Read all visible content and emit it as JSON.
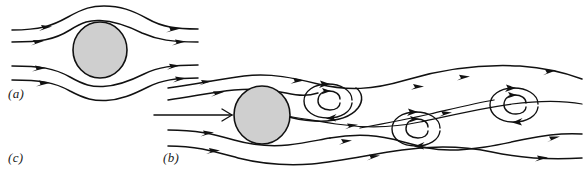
{
  "figure": {
    "background_color": "#ffffff",
    "line_color": "#111111",
    "cylinder_fill_color": "#cfcfcf",
    "width": 584,
    "height": 182
  },
  "labels": {
    "a": "(a)",
    "b": "(b)",
    "c": "(c)"
  },
  "panels": [
    {
      "id": "a",
      "label": "(a)",
      "caption": "",
      "flow_regime": "steady attached laminar flow",
      "cylinder": {
        "cx": 100,
        "cy": 50,
        "r": 27
      },
      "streamline_count": 4,
      "vortex_count": 0,
      "arrow_count": 8,
      "flow_direction": "left-to-right"
    },
    {
      "id": "b",
      "label": "(b)",
      "caption": "",
      "flow_regime": "vortex street / unsteady wake",
      "cylinder": {
        "cx": 262,
        "cy": 115,
        "r": 28
      },
      "streamline_count": 5,
      "vortex_count": 3,
      "arrow_count": 22,
      "flow_direction": "left-to-right"
    },
    {
      "id": "c",
      "label": "(c)",
      "caption": "",
      "flow_regime": "",
      "cylinder": null,
      "streamline_count": 0,
      "vortex_count": 0,
      "arrow_count": 0,
      "flow_direction": ""
    }
  ],
  "vortices": [
    {
      "name": "vortex-1",
      "cx": 330,
      "cy": 103,
      "rx": 26,
      "ry": 17,
      "rotation": "clockwise",
      "turns": 2
    },
    {
      "name": "vortex-2",
      "cx": 418,
      "cy": 131,
      "rx": 26,
      "ry": 17,
      "rotation": "clockwise",
      "turns": 2
    },
    {
      "name": "vortex-3",
      "cx": 514,
      "cy": 107,
      "rx": 26,
      "ry": 17,
      "rotation": "clockwise",
      "turns": 2
    }
  ]
}
